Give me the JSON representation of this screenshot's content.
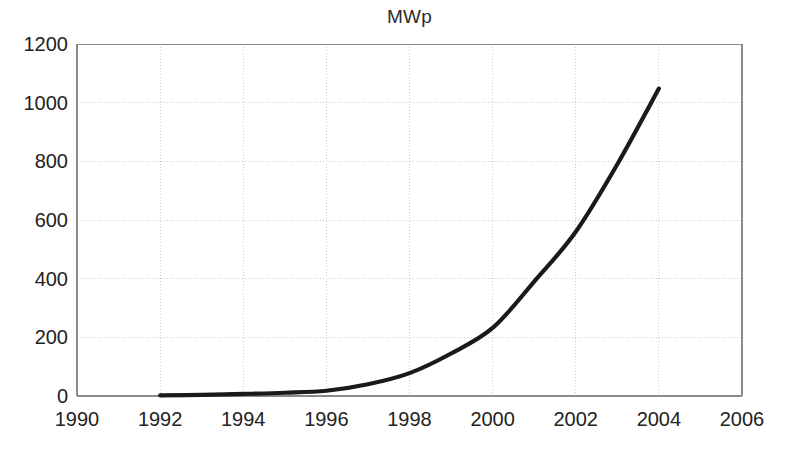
{
  "chart_data": {
    "type": "line",
    "title": "MWp",
    "xlabel": "",
    "ylabel": "",
    "xlim": [
      1990,
      2006
    ],
    "ylim": [
      0,
      1200
    ],
    "grid": true,
    "legend": false,
    "legend_position": "none",
    "line_color": "#1a1a1a",
    "grid_color": "#cccccc",
    "axis_color": "#8a8a8a",
    "x_ticks": [
      1990,
      1992,
      1994,
      1996,
      1998,
      2000,
      2002,
      2004,
      2006
    ],
    "y_ticks": [
      0,
      200,
      400,
      600,
      800,
      1000,
      1200
    ],
    "x_tick_labels": [
      "1990",
      "1992",
      "1994",
      "1996",
      "1998",
      "2000",
      "2002",
      "2004",
      "2006"
    ],
    "y_tick_labels": [
      "0",
      "200",
      "400",
      "600",
      "800",
      "1000",
      "1200"
    ],
    "series": [
      {
        "name": "MWp",
        "x": [
          1992,
          1993,
          1994,
          1995,
          1996,
          1997,
          1998,
          1999,
          2000,
          2001,
          2002,
          2003,
          2004
        ],
        "values": [
          2,
          4,
          7,
          11,
          18,
          40,
          78,
          145,
          232,
          390,
          560,
          790,
          1048
        ]
      }
    ]
  },
  "axes_geometry": {
    "plot_left_px": 77,
    "plot_right_px": 742,
    "plot_top_px": 44,
    "plot_bottom_px": 396
  }
}
